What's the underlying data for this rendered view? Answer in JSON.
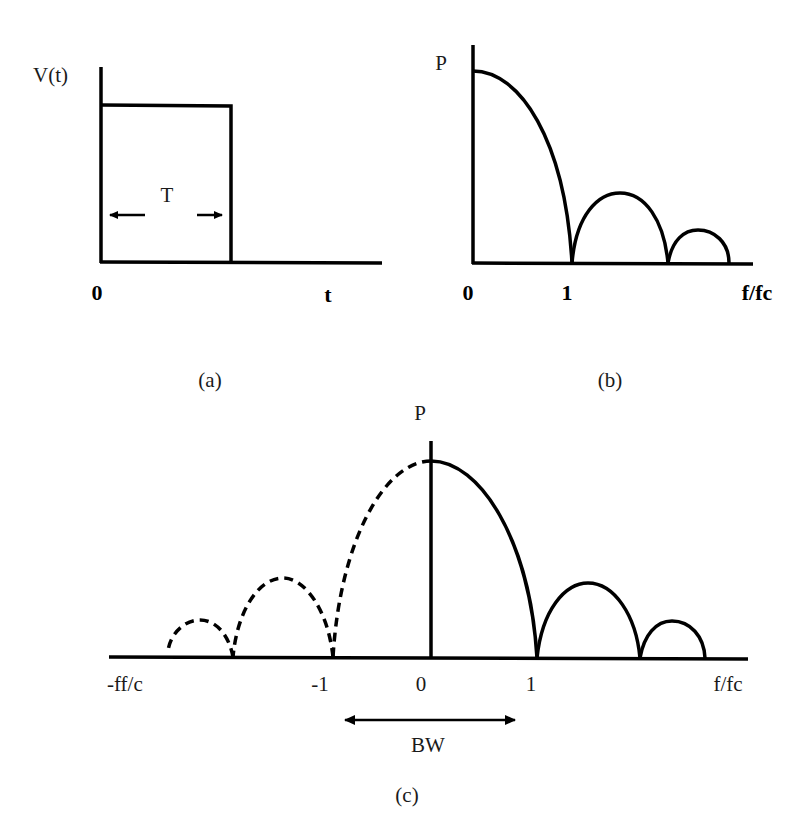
{
  "panels": {
    "a": {
      "caption": "(a)",
      "y_label": "V(t)",
      "x_label": "t",
      "origin_label": "0",
      "width_label": "T",
      "description": "Rectangular pulse of duration T"
    },
    "b": {
      "caption": "(b)",
      "y_label": "P",
      "x_label": "f/fc",
      "ticks": [
        "0",
        "1"
      ],
      "description": "One-sided power spectrum with main lobe and two sidelobes"
    },
    "c": {
      "caption": "(c)",
      "y_label": "P",
      "x_label_right": "f/fc",
      "x_label_left": "-ff/c",
      "ticks": [
        "-1",
        "0",
        "1"
      ],
      "bandwidth_label": "BW",
      "description": "Two-sided power spectrum; negative-frequency half drawn dashed"
    }
  },
  "colors": {
    "line": "#000000",
    "text": "#1a1a1a",
    "background": "#ffffff"
  }
}
